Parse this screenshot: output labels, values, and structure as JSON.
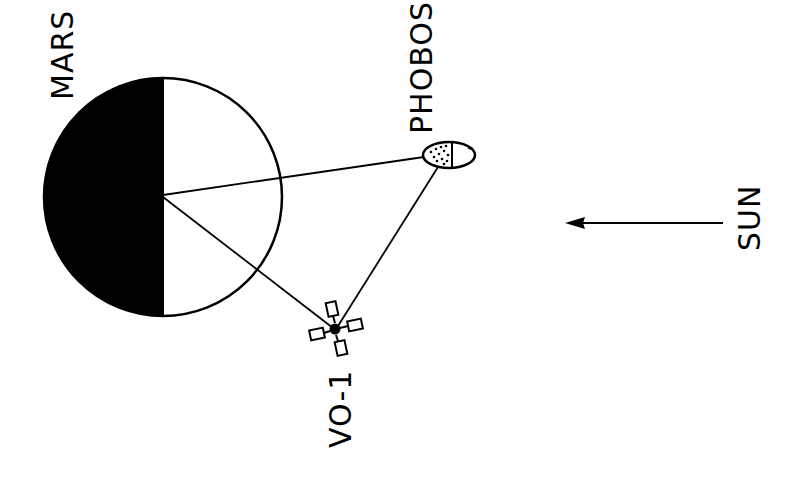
{
  "diagram": {
    "labels": {
      "mars": "MARS",
      "phobos": "PHOBOS",
      "spacecraft": "VO-1",
      "sun": "SUN"
    },
    "colors": {
      "ink": "#000000",
      "paper": "#ffffff"
    },
    "elements": [
      {
        "id": "mars",
        "type": "planet",
        "shading": "left half dark (night side)"
      },
      {
        "id": "phobos",
        "type": "moon",
        "shading": "left half stippled"
      },
      {
        "id": "vo-1",
        "type": "spacecraft",
        "panels": 4
      },
      {
        "id": "sun-arrow",
        "type": "arrow",
        "direction": "left"
      }
    ],
    "connections": [
      {
        "from": "mars-center",
        "to": "phobos"
      },
      {
        "from": "mars-center",
        "to": "vo-1"
      },
      {
        "from": "phobos",
        "to": "vo-1"
      }
    ]
  }
}
